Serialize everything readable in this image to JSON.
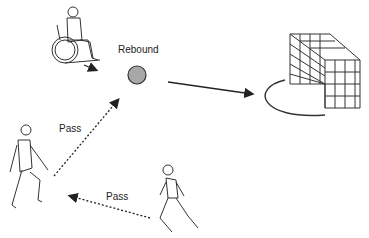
{
  "labels": {
    "rebound": "Rebound",
    "pass_upper": "Pass",
    "pass_lower": "Pass"
  },
  "figures": {
    "wheelchair_player": "wheelchair-user-figure",
    "left_player": "standing-player-figure",
    "bottom_player": "running-player-figure",
    "goal": "goal-net",
    "ball": "ball"
  },
  "colors": {
    "ball_fill": "#a8a8a8",
    "line": "#222222"
  }
}
